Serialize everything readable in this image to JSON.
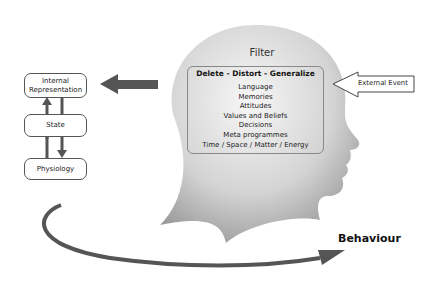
{
  "diagram": {
    "filter": {
      "title": "Filter",
      "heading": "Delete - Distort - Generalize",
      "items": [
        "Language",
        "Memories",
        "Attitudes",
        "Values and Beliefs",
        "Decisions",
        "Meta programmes",
        "Time / Space / Matter / Energy"
      ]
    },
    "external_event": "External Event",
    "loop": {
      "internal_representation_line1": "Internal",
      "internal_representation_line2": "Representation",
      "state": "State",
      "physiology": "Physiology"
    },
    "behaviour": "Behaviour",
    "colors": {
      "arrow": "#555555",
      "head": "#c8c8c8",
      "border": "#555555"
    }
  }
}
